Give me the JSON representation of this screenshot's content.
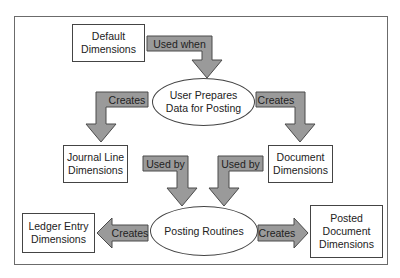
{
  "diagram": {
    "type": "flow",
    "colors": {
      "arrow_fill": "#9a9a9a",
      "arrow_stroke": "#4a4a4a",
      "box_border": "#444444",
      "frame_border": "#6b6b6b"
    },
    "nodes": {
      "default_dimensions": {
        "line1": "Default",
        "line2": "Dimensions"
      },
      "user_prepares": {
        "line1": "User Prepares",
        "line2": "Data for Posting"
      },
      "journal_line_dimensions": {
        "line1": "Journal Line",
        "line2": "Dimensions"
      },
      "document_dimensions": {
        "line1": "Document",
        "line2": "Dimensions"
      },
      "posting_routines": {
        "label": "Posting Routines"
      },
      "ledger_entry_dimensions": {
        "line1": "Ledger Entry",
        "line2": "Dimensions"
      },
      "posted_document_dimensions": {
        "line1": "Posted",
        "line2": "Document",
        "line3": "Dimensions"
      }
    },
    "edges": {
      "used_when": "Used when",
      "creates_journal": "Creates",
      "creates_document": "Creates",
      "used_by_journal": "Used by",
      "used_by_document": "Used by",
      "creates_ledger": "Creates",
      "creates_posted": "Creates"
    }
  }
}
